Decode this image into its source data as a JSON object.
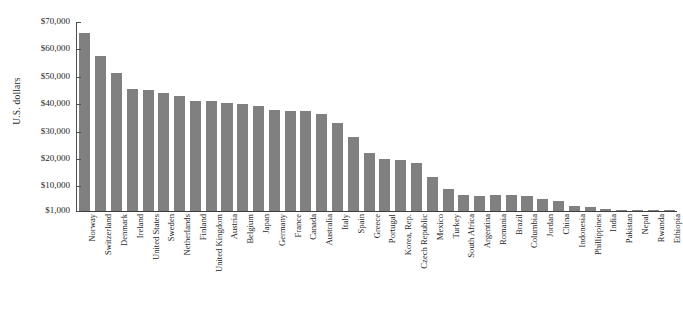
{
  "chart_data": {
    "type": "bar",
    "title": "",
    "subtitle": "",
    "xlabel": "",
    "ylabel": "U.S. dollars",
    "ylim": [
      1000,
      70000
    ],
    "grid": false,
    "legend": null,
    "bar_color": "#808080",
    "axis_color": "#3d3d3d",
    "y_ticks": [
      {
        "value": 70000,
        "label": "$70,000"
      },
      {
        "value": 60000,
        "label": "$60,000"
      },
      {
        "value": 50000,
        "label": "$50,000"
      },
      {
        "value": 40000,
        "label": "$40,000"
      },
      {
        "value": 30000,
        "label": "$30,000"
      },
      {
        "value": 20000,
        "label": "$20,000"
      },
      {
        "value": 10000,
        "label": "$10,000"
      },
      {
        "value": 1000,
        "label": "$1,000"
      }
    ],
    "categories": [
      "Norway",
      "Switzerland",
      "Denmark",
      "Ireland",
      "United States",
      "Sweden",
      "Netherlands",
      "Finland",
      "United Kingdom",
      "Austria",
      "Belgium",
      "Japan",
      "Germany",
      "France",
      "Canada",
      "Australia",
      "Italy",
      "Spain",
      "Greece",
      "Portugal",
      "Korea, Rep.",
      "Czech Republic",
      "Mexico",
      "Turkey",
      "South Africa",
      "Argentina",
      "Romania",
      "Brazil",
      "Columbia",
      "Jordan",
      "China",
      "Indonesia",
      "Phillippines",
      "India",
      "Pakistan",
      "Nepal",
      "Rwanda",
      "Ethiopia"
    ],
    "values": [
      66000,
      57500,
      51500,
      45500,
      45000,
      44000,
      43000,
      41000,
      41000,
      40500,
      40000,
      39500,
      38000,
      37500,
      37500,
      36500,
      33000,
      28000,
      22000,
      20000,
      19500,
      18500,
      13500,
      9000,
      7000,
      6500,
      7000,
      7000,
      6500,
      5500,
      4500,
      3000,
      2500,
      1800,
      1200,
      1100,
      900,
      700
    ]
  }
}
